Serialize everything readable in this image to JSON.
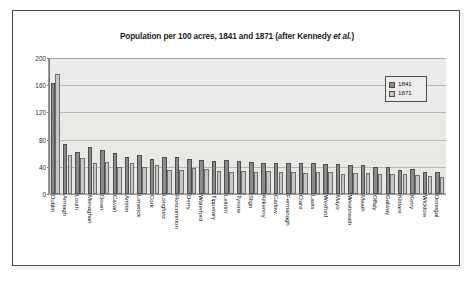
{
  "figure": {
    "title_main": "Population per 100 acres, 1841 and 1871 (after Kennedy ",
    "title_italic": "et al.",
    "title_tail": ")",
    "title_full": "Population per 100 acres, 1841 and 1871 (after Kennedy et al.)",
    "frame_color": "#4b4b4b",
    "plot_bg_color": "#eceae7",
    "gridline_color": "#b9b7b4"
  },
  "legend": {
    "position": "top-right",
    "entries": [
      {
        "label": "1841",
        "color": "#8a8a8a"
      },
      {
        "label": "1871",
        "color": "#c8c7c4"
      }
    ]
  },
  "axes": {
    "y_ticks": [
      "200",
      "160",
      "120",
      "80",
      "40",
      "0"
    ],
    "y_values": [
      200,
      160,
      120,
      80,
      40,
      0
    ],
    "ylim": [
      0,
      200
    ],
    "xlabel": "",
    "ylabel": ""
  },
  "chart_data": {
    "type": "bar",
    "title": "Population per 100 acres, 1841 and 1871 (after Kennedy et al.)",
    "xlabel": "",
    "ylabel": "",
    "ylim": [
      0,
      200
    ],
    "yticks": [
      0,
      40,
      80,
      120,
      160,
      200
    ],
    "grid": true,
    "legend_position": "top-right",
    "categories": [
      "Dublin",
      "Armagh",
      "Louth",
      "Monaghan",
      "Down",
      "Cavan",
      "Antrim",
      "Limerick",
      "Cork",
      "Longford",
      "Roscommon",
      "Derry",
      "Waterford",
      "Tipperary",
      "Leitrim",
      "Tyrone",
      "Sligo",
      "Kilkenny",
      "Carlow",
      "Fermanagh",
      "Clare",
      "Laois",
      "Wexford",
      "Mayo",
      "Westmeath",
      "Meath",
      "Offaly",
      "Galway",
      "Kildare",
      "Kerry",
      "Wicklow",
      "Donegal"
    ],
    "series": [
      {
        "name": "1841",
        "color": "#8a8a8a",
        "values": [
          163,
          74,
          62,
          69,
          64,
          60,
          55,
          57,
          51,
          55,
          54,
          52,
          50,
          49,
          50,
          48,
          47,
          46,
          46,
          45,
          45,
          45,
          44,
          44,
          43,
          42,
          40,
          39,
          36,
          37,
          32,
          33
        ]
      },
      {
        "name": "1871",
        "color": "#c8c7c4",
        "values": [
          177,
          57,
          53,
          45,
          47,
          40,
          46,
          39,
          42,
          36,
          35,
          38,
          37,
          34,
          32,
          34,
          33,
          34,
          33,
          32,
          31,
          32,
          33,
          30,
          31,
          31,
          30,
          29,
          29,
          28,
          26,
          25
        ]
      }
    ]
  }
}
